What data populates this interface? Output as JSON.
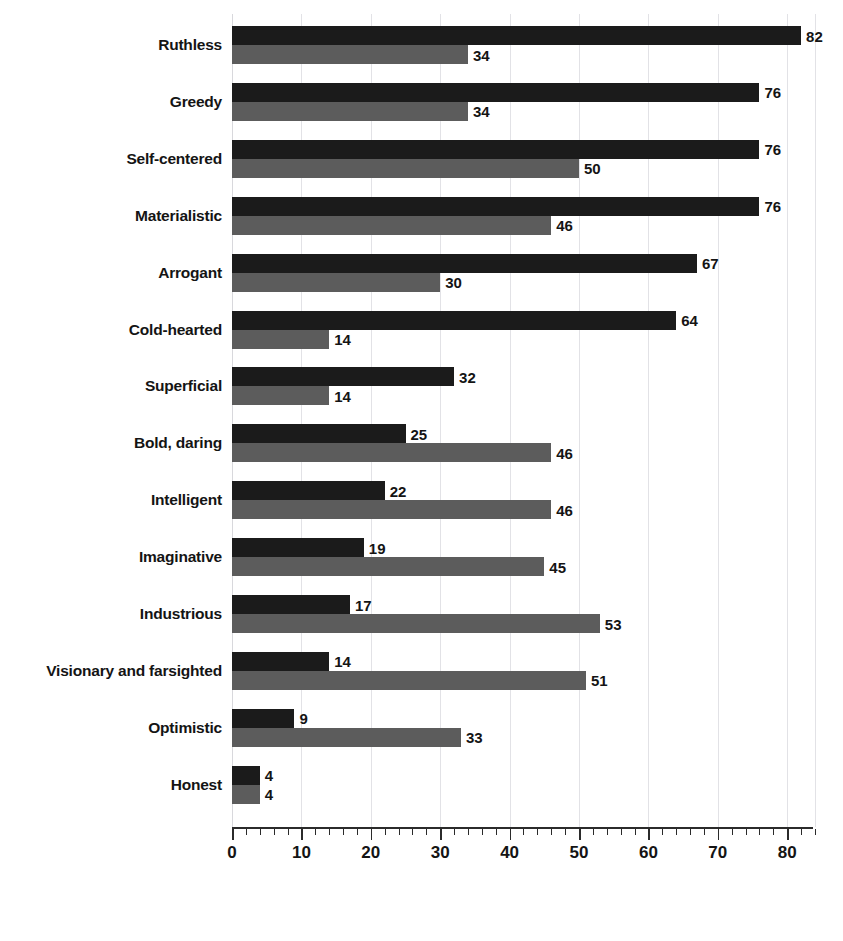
{
  "chart_data": {
    "type": "bar",
    "orientation": "horizontal",
    "title": "",
    "subtitle": "",
    "xlabel": "",
    "ylabel": "",
    "xlim": [
      0,
      84
    ],
    "grid": true,
    "gridline_interval": 10,
    "legend_position": "none",
    "axis_ticks": [
      "0",
      "10",
      "20",
      "30",
      "40",
      "50",
      "60",
      "70",
      "80"
    ],
    "axis_tick_values": [
      0,
      10,
      20,
      30,
      40,
      50,
      60,
      70,
      80
    ],
    "minor_tick_interval": 2,
    "categories": [
      "Ruthless",
      "Greedy",
      "Self-centered",
      "Materialistic",
      "Arrogant",
      "Cold-hearted",
      "Superficial",
      "Bold, daring",
      "Intelligent",
      "Imaginative",
      "Industrious",
      "Visionary and farsighted",
      "Optimistic",
      "Honest"
    ],
    "series": [
      {
        "name": "series-dark",
        "color": "#1b1b1b",
        "values": [
          82,
          76,
          76,
          76,
          67,
          64,
          32,
          25,
          22,
          19,
          17,
          14,
          9,
          4
        ]
      },
      {
        "name": "series-light",
        "color": "#5c5c5c",
        "values": [
          34,
          34,
          50,
          46,
          30,
          14,
          14,
          46,
          46,
          45,
          53,
          51,
          33,
          4
        ]
      }
    ]
  },
  "colors": {
    "dark_bar": "#1b1b1b",
    "light_bar": "#5c5c5c",
    "gridline": "#e2e2e6",
    "axis": "#2b2b2b",
    "text": "#141414",
    "background": "#ffffff"
  },
  "top_strip": {
    "ghost_text": ""
  }
}
